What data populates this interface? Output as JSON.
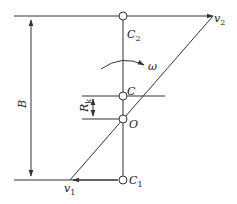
{
  "diagram": {
    "labels": {
      "v2": "v",
      "v2_sub": "2",
      "v1": "v",
      "v1_sub": "1",
      "C2": "C",
      "C2_sub": "2",
      "C": "C",
      "O": "O",
      "C1": "C",
      "C1_sub": "1",
      "omega": "ω",
      "B": "B",
      "Rk": "R",
      "Rk_sub": "k"
    },
    "colors": {
      "line": "#333333",
      "background": "#ffffff"
    }
  }
}
